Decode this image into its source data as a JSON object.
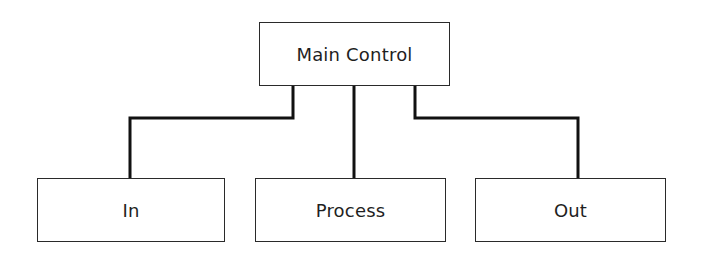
{
  "diagram": {
    "type": "hierarchy",
    "colors": {
      "line": "#111111",
      "box_border": "#2a2a2a",
      "text": "#1f1f1f",
      "background": "#ffffff"
    },
    "root": {
      "label": "Main Control"
    },
    "children": [
      {
        "label": "In"
      },
      {
        "label": "Process"
      },
      {
        "label": "Out"
      }
    ]
  }
}
